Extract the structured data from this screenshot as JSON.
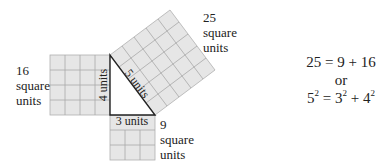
{
  "diagram": {
    "colors": {
      "square_fill": "#e6e6e6",
      "grid_line": "#a8a8a8",
      "triangle_edge": "#222222"
    },
    "unit_px": 15,
    "triangle": {
      "legs": {
        "vertical": 4,
        "horizontal": 3
      },
      "hypotenuse": 5,
      "edge_labels": {
        "vertical": "4 units",
        "horizontal": "3 units",
        "hypotenuse": "5 units"
      }
    },
    "squares": [
      {
        "side": 4,
        "area_label": "16",
        "line2": "square",
        "line3": "units"
      },
      {
        "side": 3,
        "area_label": "9",
        "line2": "square",
        "line3": "units"
      },
      {
        "side": 5,
        "area_label": "25",
        "line2": "square",
        "line3": "units"
      }
    ],
    "equation": {
      "line1": "25 = 9 + 16",
      "line2": "or",
      "line3": {
        "a": "5",
        "b": "3",
        "c": "4",
        "exp": "2",
        "eq": " = ",
        "plus": " + "
      }
    }
  }
}
